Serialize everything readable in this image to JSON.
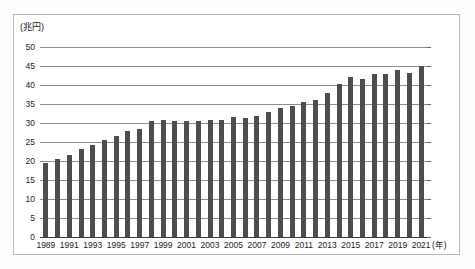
{
  "chart_data": {
    "type": "bar",
    "title": "",
    "subtitle": "",
    "unit_label": "(兆円)",
    "xlabel": "(年)",
    "ylabel": "",
    "ylim": [
      0,
      50
    ],
    "ytick_step": 5,
    "grid": true,
    "legend": null,
    "bar_color": "#4d4d4d",
    "categories": [
      "1989",
      "1990",
      "1991",
      "1992",
      "1993",
      "1994",
      "1995",
      "1996",
      "1997",
      "1998",
      "1999",
      "2000",
      "2001",
      "2002",
      "2003",
      "2004",
      "2005",
      "2006",
      "2007",
      "2008",
      "2009",
      "2010",
      "2011",
      "2012",
      "2013",
      "2014",
      "2015",
      "2016",
      "2017",
      "2018",
      "2019",
      "2020",
      "2021"
    ],
    "values": [
      19.5,
      20.4,
      21.6,
      23.2,
      24.1,
      25.4,
      26.5,
      28.0,
      28.5,
      30.6,
      30.7,
      30.5,
      30.6,
      30.4,
      30.7,
      30.9,
      31.5,
      31.4,
      31.8,
      33.0,
      33.9,
      34.5,
      35.4,
      36.0,
      38.0,
      40.2,
      42.0,
      41.6,
      42.8,
      43.0,
      44.0,
      43.1,
      45.0
    ],
    "ytick_labels": [
      "50",
      "45",
      "40",
      "35",
      "30",
      "25",
      "20",
      "15",
      "10",
      "5",
      "0"
    ],
    "xtick_labels": [
      "1989",
      "1991",
      "1993",
      "1995",
      "1997",
      "1999",
      "2001",
      "2003",
      "2005",
      "2007",
      "2009",
      "2011",
      "2013",
      "2015",
      "2017",
      "2019",
      "2021"
    ]
  }
}
